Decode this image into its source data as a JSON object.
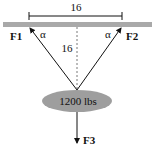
{
  "diagram": {
    "type": "force-diagram",
    "top_dimension": "16",
    "vertical_dimension": "16",
    "angle_left": "α",
    "angle_right": "α",
    "force_left": "F1",
    "force_right": "F2",
    "force_down": "F3",
    "weight_label": "1200 lbs",
    "colors": {
      "beam": "#a9a9a9",
      "weight": "#9e9e9e",
      "lines": "#111111"
    }
  }
}
